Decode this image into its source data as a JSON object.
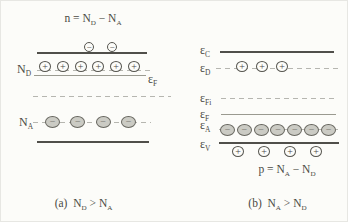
{
  "figure": {
    "colors": {
      "background": "#fcfcf9",
      "band_line": "#504f4a",
      "fermi_line": "#9a9a90",
      "dashed_level": "#b6b6b0",
      "acceptor_fill": "#cbcbc4",
      "text": "#4a4a44"
    },
    "panel_a": {
      "title": [
        {
          "t": "n = N"
        },
        {
          "sub": "D"
        },
        {
          "t": " − N"
        },
        {
          "sub": "A"
        }
      ],
      "donor_label": [
        {
          "t": "N"
        },
        {
          "sub": "D"
        }
      ],
      "acceptor_label": [
        {
          "t": "N"
        },
        {
          "sub": "A"
        }
      ],
      "fermi_label": [
        {
          "t": "ε"
        },
        {
          "sub": "F"
        }
      ],
      "caption": [
        {
          "t": "(a)  N"
        },
        {
          "sub": "D"
        },
        {
          "t": " > N"
        },
        {
          "sub": "A"
        }
      ],
      "electrons_above_conduction": {
        "count": 2,
        "symbol": "−",
        "style": "open-minus",
        "icon_name": "electron-minus-circle-icon"
      },
      "ionized_donors": {
        "count": 6,
        "symbol": "+",
        "style": "open-plus",
        "icon_name": "donor-plus-circle-icon"
      },
      "ionized_acceptors": {
        "count": 4,
        "symbol": "−",
        "style": "filled-minus",
        "icon_name": "acceptor-minus-circle-icon"
      }
    },
    "panel_b": {
      "conduction_label": [
        {
          "t": "ε"
        },
        {
          "sub": "C"
        }
      ],
      "donor_level_label": [
        {
          "t": "ε"
        },
        {
          "sub": "D"
        }
      ],
      "intrinsic_fermi_label": [
        {
          "t": "ε"
        },
        {
          "sub": "Fi"
        }
      ],
      "fermi_label": [
        {
          "t": "ε"
        },
        {
          "sub": "F"
        }
      ],
      "acceptor_level_label": [
        {
          "t": "ε"
        },
        {
          "sub": "A"
        }
      ],
      "valence_label": [
        {
          "t": "ε"
        },
        {
          "sub": "V"
        }
      ],
      "equation": [
        {
          "t": "p = N"
        },
        {
          "sub": "A"
        },
        {
          "t": " − N"
        },
        {
          "sub": "D"
        }
      ],
      "caption": [
        {
          "t": "(b)  N"
        },
        {
          "sub": "A"
        },
        {
          "t": " > N"
        },
        {
          "sub": "D"
        }
      ],
      "ionized_donors": {
        "count": 3,
        "symbol": "+",
        "style": "open-plus",
        "icon_name": "donor-plus-circle-icon"
      },
      "ionized_acceptors": {
        "count": 7,
        "symbol": "−",
        "style": "filled-minus",
        "icon_name": "acceptor-minus-circle-icon"
      },
      "holes_below_valence": {
        "count": 4,
        "symbol": "+",
        "style": "open-plus",
        "icon_name": "hole-plus-circle-icon"
      }
    }
  }
}
